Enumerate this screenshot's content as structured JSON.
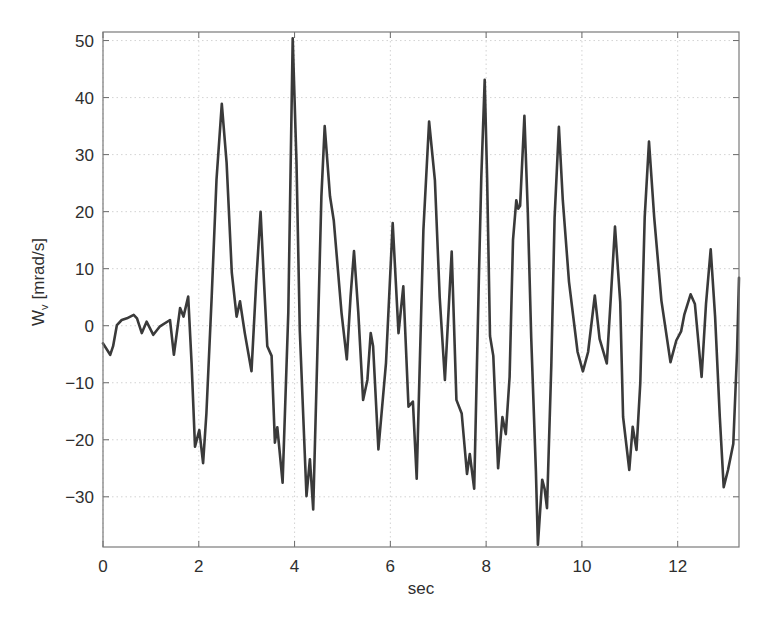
{
  "chart_data": {
    "type": "line",
    "title": "",
    "xlabel": "sec",
    "ylabel": "W",
    "ylabel_subscript": "v",
    "ylabel_units": "[mrad/s]",
    "xlim": [
      0,
      13.28
    ],
    "ylim": [
      -38.8,
      51.5
    ],
    "xticks": [
      0,
      2,
      4,
      6,
      8,
      10,
      12
    ],
    "xtick_labels": [
      "0",
      "2",
      "4",
      "6",
      "8",
      "10",
      "12"
    ],
    "yticks": [
      -30,
      -20,
      -10,
      0,
      10,
      20,
      30,
      40,
      50
    ],
    "ytick_labels": [
      "−30",
      "−20",
      "−10",
      "0",
      "10",
      "20",
      "30",
      "40",
      "50"
    ],
    "grid": true,
    "legend": null,
    "series": [
      {
        "name": "W_v",
        "color": "#3a3a3a",
        "x": [
          0.0,
          0.15,
          0.21,
          0.29,
          0.39,
          0.5,
          0.64,
          0.71,
          0.81,
          0.91,
          1.05,
          1.19,
          1.4,
          1.48,
          1.61,
          1.68,
          1.78,
          1.85,
          1.92,
          2.01,
          2.09,
          2.16,
          2.27,
          2.37,
          2.48,
          2.58,
          2.69,
          2.79,
          2.86,
          2.96,
          3.1,
          3.2,
          3.29,
          3.36,
          3.43,
          3.52,
          3.59,
          3.64,
          3.75,
          3.87,
          3.96,
          4.04,
          4.11,
          4.25,
          4.32,
          4.39,
          4.47,
          4.56,
          4.63,
          4.74,
          4.82,
          4.98,
          5.09,
          5.17,
          5.24,
          5.33,
          5.43,
          5.52,
          5.59,
          5.64,
          5.75,
          5.91,
          6.05,
          6.17,
          6.27,
          6.38,
          6.47,
          6.55,
          6.69,
          6.81,
          6.93,
          7.03,
          7.14,
          7.28,
          7.38,
          7.49,
          7.6,
          7.66,
          7.75,
          7.85,
          7.9,
          7.97,
          8.02,
          8.08,
          8.15,
          8.25,
          8.34,
          8.41,
          8.49,
          8.56,
          8.63,
          8.67,
          8.71,
          8.8,
          8.87,
          8.94,
          9.04,
          9.08,
          9.17,
          9.22,
          9.27,
          9.36,
          9.43,
          9.52,
          9.6,
          9.73,
          9.91,
          10.02,
          10.13,
          10.27,
          10.37,
          10.52,
          10.6,
          10.69,
          10.8,
          10.86,
          10.99,
          11.06,
          11.14,
          11.22,
          11.31,
          11.4,
          11.51,
          11.66,
          11.85,
          11.97,
          12.07,
          12.14,
          12.27,
          12.36,
          12.5,
          12.59,
          12.69,
          12.78,
          12.88,
          12.96,
          13.05,
          13.16,
          13.24,
          13.28
        ],
        "y": [
          -3.1,
          -5.1,
          -3.6,
          0.1,
          1.0,
          1.3,
          1.9,
          1.3,
          -1.3,
          0.7,
          -1.6,
          -0.1,
          1.0,
          -5.1,
          3.1,
          1.6,
          5.1,
          -6.6,
          -21.2,
          -18.3,
          -24.1,
          -15.4,
          5.1,
          25.6,
          38.9,
          28.6,
          9.3,
          1.6,
          4.3,
          -1.3,
          -8.0,
          8.0,
          20.0,
          8.0,
          -3.6,
          -5.3,
          -20.5,
          -17.8,
          -27.5,
          2.3,
          50.4,
          28.6,
          -0.9,
          -29.9,
          -23.4,
          -32.2,
          -6.5,
          22.7,
          35.0,
          22.7,
          18.4,
          2.3,
          -5.9,
          5.2,
          13.1,
          2.3,
          -13.0,
          -9.5,
          -1.3,
          -3.6,
          -21.7,
          -6.5,
          18.0,
          -1.3,
          6.9,
          -14.2,
          -13.3,
          -26.8,
          16.8,
          35.8,
          25.5,
          5.0,
          -9.5,
          13.0,
          -13.0,
          -15.4,
          -26.0,
          -22.5,
          -28.6,
          8.5,
          26.0,
          43.1,
          26.0,
          -1.8,
          -5.3,
          -25.0,
          -16.0,
          -19.0,
          -9.0,
          15.0,
          22.0,
          20.5,
          21.0,
          36.8,
          20.0,
          -2.0,
          -25.5,
          -38.4,
          -27.0,
          -28.6,
          -32.0,
          -7.0,
          19.0,
          34.9,
          22.0,
          7.7,
          -4.6,
          -8.0,
          -4.6,
          5.3,
          -2.3,
          -6.6,
          4.6,
          17.4,
          4.2,
          -16.0,
          -25.3,
          -17.7,
          -21.8,
          -10.0,
          19.0,
          32.3,
          19.0,
          4.4,
          -6.4,
          -2.6,
          -1.0,
          2.0,
          5.5,
          3.8,
          -9.0,
          3.8,
          13.4,
          1.6,
          -16.0,
          -28.3,
          -25.3,
          -20.7,
          -4.4,
          8.4
        ]
      }
    ]
  }
}
